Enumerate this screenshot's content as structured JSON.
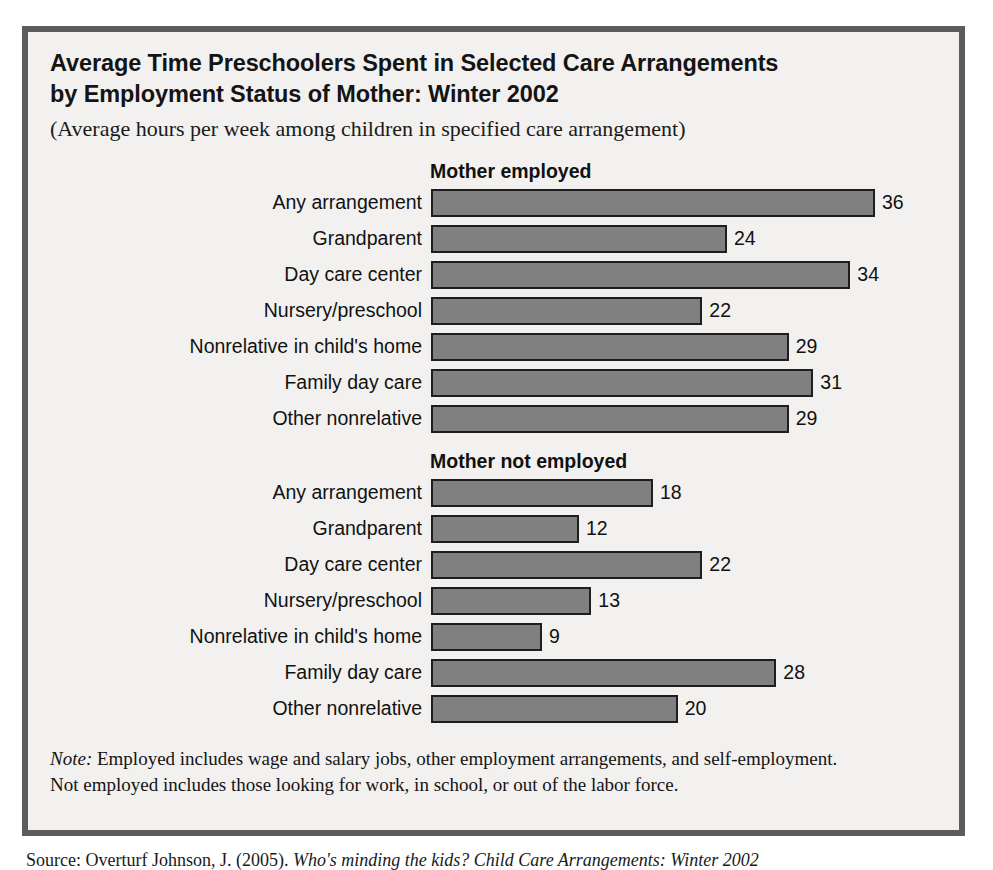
{
  "figure": {
    "title_line_1": "Average Time Preschoolers Spent in Selected Care Arrangements",
    "title_line_2": "by Employment Status of Mother: Winter 2002",
    "subtitle": "(Average hours per week among children in specified care arrangement)",
    "note_label": "Note:",
    "note_line_1": " Employed includes wage and salary jobs, other employment arrangements, and self-employment.",
    "note_line_2": "Not employed includes those looking for work, in school, or out of the labor force.",
    "source_label": "Source: Overturf Johnson, J. (2005). ",
    "source_title": "Who's minding the kids? Child Care Arrangements: Winter 2002"
  },
  "colors": {
    "bar_fill": "#808080",
    "bar_border": "#1e1e1e",
    "panel_border": "#5c5c5c",
    "panel_background": "#f2f1ef",
    "text": "#111111"
  },
  "chart_data": {
    "type": "bar",
    "orientation": "horizontal",
    "title": "Average Time Preschoolers Spent in Selected Care Arrangements by Employment Status of Mother: Winter 2002",
    "subtitle": "(Average hours per week among children in specified care arrangement)",
    "xlabel": "",
    "ylabel": "",
    "xlim": [
      0,
      36
    ],
    "grid": false,
    "legend": "none",
    "value_labels": true,
    "units": "average hours per week",
    "categories": [
      "Any arrangement",
      "Grandparent",
      "Day care center",
      "Nursery/preschool",
      "Nonrelative in child's home",
      "Family day care",
      "Other nonrelative"
    ],
    "series": [
      {
        "name": "Mother employed",
        "values": [
          36,
          24,
          34,
          22,
          29,
          31,
          29
        ]
      },
      {
        "name": "Mother not employed",
        "values": [
          18,
          12,
          22,
          13,
          9,
          28,
          20
        ]
      }
    ]
  }
}
